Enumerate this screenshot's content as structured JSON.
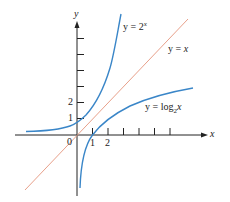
{
  "figure": {
    "axes": {
      "x_label": "x",
      "y_label": "y",
      "origin_label": "0",
      "x_tick_labels": [
        "1",
        "2"
      ],
      "y_tick_labels": [
        "1",
        "2"
      ],
      "x_ticks": [
        1,
        2,
        3,
        4,
        5,
        6
      ],
      "y_ticks": [
        1,
        2,
        3,
        4,
        5,
        6
      ]
    },
    "curves": [
      {
        "name": "exponential",
        "equation_prefix": "y = 2",
        "equation_sup": "x",
        "color": "#3a86c8"
      },
      {
        "name": "identity",
        "equation_prefix": "y = ",
        "equation_var": "x",
        "color": "#e8a08a"
      },
      {
        "name": "logarithm",
        "equation_prefix": "y = log",
        "equation_sub": "2",
        "equation_var": "x",
        "color": "#3a86c8"
      }
    ],
    "colors": {
      "axis": "#222222",
      "curve_blue": "#3a86c8",
      "line_salmon": "#e8a08a"
    }
  }
}
